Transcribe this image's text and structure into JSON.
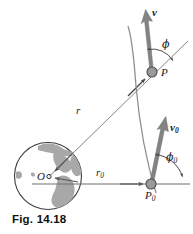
{
  "figure": {
    "caption": "Fig. 14.18",
    "labels": {
      "velocity_at_p": "v",
      "velocity_at_p0_base": "v",
      "velocity_at_p0_sub": "0",
      "point_p": "P",
      "point_p0_base": "P",
      "point_p0_sub": "0",
      "center": "O",
      "radius_r": "r",
      "radius_r0_base": "r",
      "radius_r0_sub": "0",
      "angle_phi": "ϕ",
      "angle_phi0_base": "ϕ",
      "angle_phi0_sub": "0"
    },
    "colors": {
      "line": "#6e6e6e",
      "vector": "#7a7a7a",
      "vector_dark": "#5e5e5e",
      "marker_fill": "#9a9a9a",
      "marker_stroke": "#4a4a4a",
      "globe_stroke": "#3d3d3d",
      "continent": "#a8a8a8",
      "text": "#1a1a1a",
      "background": "#ffffff"
    },
    "geometry": {
      "globe_center_x": 48,
      "globe_center_y": 176,
      "globe_radius": 34,
      "point_p_x": 152,
      "point_p_y": 72,
      "point_p0_x": 151,
      "point_p0_y": 184,
      "baseline_y": 184
    }
  }
}
